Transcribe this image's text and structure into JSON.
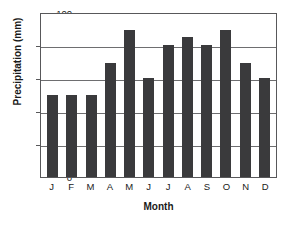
{
  "chart_data": {
    "type": "bar",
    "title": "",
    "categories": [
      "J",
      "F",
      "M",
      "A",
      "M",
      "J",
      "J",
      "A",
      "S",
      "O",
      "N",
      "D"
    ],
    "values": [
      50,
      50,
      50,
      69,
      89,
      60,
      80,
      85,
      80,
      89,
      69,
      60
    ],
    "xlabel": "Month",
    "ylabel": "Precipitation (mm)",
    "ylim": [
      0,
      100
    ],
    "yticks": [
      0,
      20,
      40,
      60,
      80,
      100
    ],
    "ytick_labels": [
      "0",
      "20",
      "40",
      "60",
      "80",
      "100"
    ],
    "grid": true,
    "legend": false,
    "bar_color": "#3a3a3c",
    "frame_color": "#58585a",
    "background": "#ffffff"
  }
}
